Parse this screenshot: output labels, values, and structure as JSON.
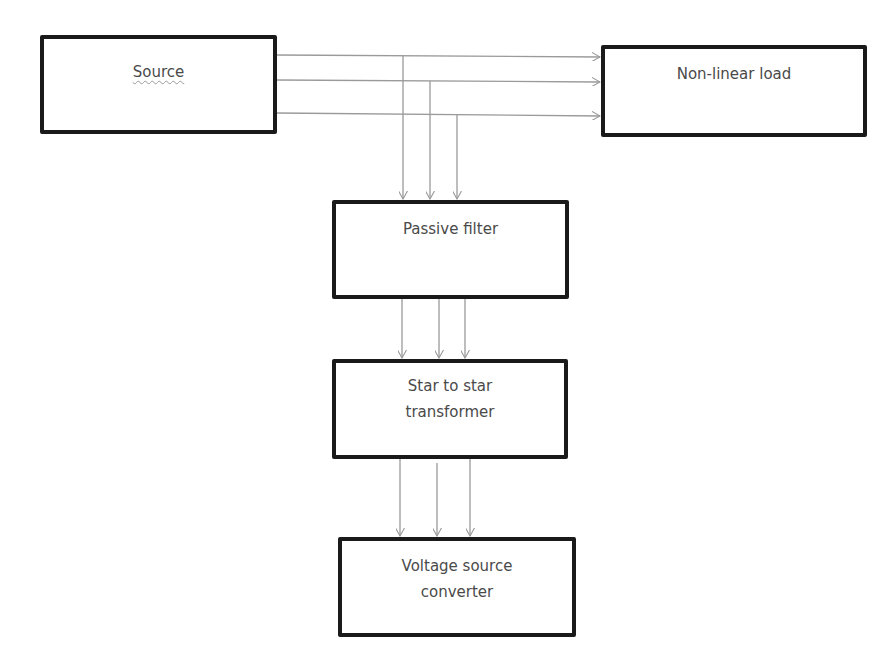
{
  "diagram": {
    "type": "block-diagram",
    "blocks": [
      {
        "id": "source",
        "label": "Source",
        "x": 40,
        "y": 35,
        "w": 237,
        "h": 99
      },
      {
        "id": "nonlinear-load",
        "label": "Non-linear load",
        "x": 601,
        "y": 45,
        "w": 266,
        "h": 92
      },
      {
        "id": "passive-filter",
        "label": "Passive filter",
        "x": 332,
        "y": 200,
        "w": 237,
        "h": 99
      },
      {
        "id": "transformer",
        "label_line1": "Star to star",
        "label_line2": "transformer",
        "x": 332,
        "y": 359,
        "w": 236,
        "h": 100
      },
      {
        "id": "vsc",
        "label_line1": "Voltage source",
        "label_line2": "converter",
        "x": 338,
        "y": 537,
        "w": 238,
        "h": 100
      }
    ],
    "connections": [
      {
        "from": "source",
        "to": "nonlinear-load",
        "lines": 3
      },
      {
        "from": "source-lines",
        "to": "passive-filter",
        "lines": 3
      },
      {
        "from": "passive-filter",
        "to": "transformer",
        "lines": 3
      },
      {
        "from": "transformer",
        "to": "vsc",
        "lines": 3
      }
    ],
    "colors": {
      "box_border": "#1a1a1a",
      "connector": "#9a9a9a",
      "text": "#4a4a4a"
    }
  }
}
